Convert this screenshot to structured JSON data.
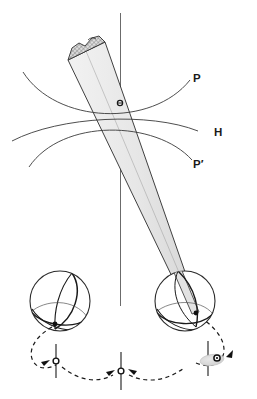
{
  "figure": {
    "background_color": "#ffffff",
    "line_color": "#2b2b2b",
    "cone_fill": "#ebebeb",
    "cone_cap_fill": "#d9d9d9",
    "width": 257,
    "height": 399
  },
  "labels": {
    "p": "P",
    "h": "H",
    "p_prime": "P′"
  },
  "curves": {
    "p_curve_name": "upper-hyperbola-p",
    "h_curve_name": "horizon-curve-h",
    "p_prime_curve_name": "lower-hyperbola-p-prime"
  },
  "elements": {
    "vertical_axis": "vertical-reference-axis",
    "cone": "light-cone-beam",
    "cone_cap": "cone-hatched-end-cap",
    "cone_marker": "cone-axis-point-marker",
    "left_sphere": "left-globe",
    "right_sphere": "right-globe",
    "apex_point": "cone-apex-point",
    "orbit_path": "dashed-orbit-path",
    "tick_left": "orbit-tick-left",
    "tick_center": "orbit-tick-center",
    "tick_right": "orbit-tick-right",
    "blob_right": "orbit-right-beam-blob"
  }
}
